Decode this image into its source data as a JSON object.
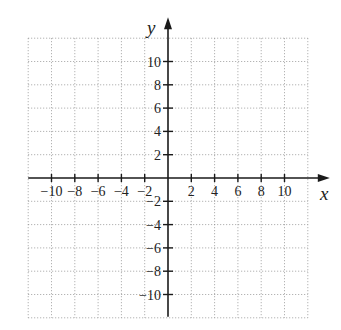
{
  "chart_data": {
    "type": "scatter",
    "title": "",
    "xlabel": "x",
    "ylabel": "y",
    "xlim": [
      -12,
      12
    ],
    "ylim": [
      -12,
      12
    ],
    "grid": true,
    "grid_step": 2,
    "legend": null,
    "series": [],
    "x_ticks": [
      -10,
      -8,
      -6,
      -4,
      -2,
      2,
      4,
      6,
      8,
      10
    ],
    "y_ticks": [
      10,
      8,
      6,
      4,
      2,
      -2,
      -4,
      -6,
      -8,
      -10
    ],
    "x_tick_labels": [
      "−10",
      "−8",
      "−6",
      "−4",
      "−2",
      "2",
      "4",
      "6",
      "8",
      "10"
    ],
    "y_tick_labels": [
      "10",
      "8",
      "6",
      "4",
      "2",
      "−2",
      "−4",
      "−6",
      "−8",
      "−10"
    ]
  },
  "axes": {
    "x_label": "x",
    "y_label": "y"
  }
}
